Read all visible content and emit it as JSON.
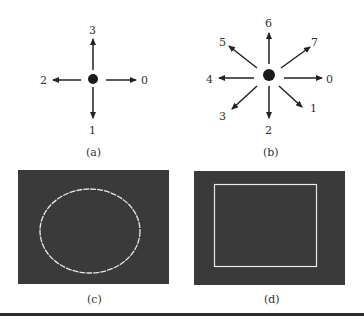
{
  "figures": {
    "a": {
      "caption": "(a)",
      "title": "4-direction chain code",
      "directions": [
        {
          "code": "0",
          "angle_deg": 0
        },
        {
          "code": "1",
          "angle_deg": 270
        },
        {
          "code": "2",
          "angle_deg": 180
        },
        {
          "code": "3",
          "angle_deg": 90
        }
      ]
    },
    "b": {
      "caption": "(b)",
      "title": "8-direction chain code",
      "directions": [
        {
          "code": "0",
          "angle_deg": 0
        },
        {
          "code": "1",
          "angle_deg": 315
        },
        {
          "code": "2",
          "angle_deg": 270
        },
        {
          "code": "3",
          "angle_deg": 225
        },
        {
          "code": "4",
          "angle_deg": 180
        },
        {
          "code": "5",
          "angle_deg": 135
        },
        {
          "code": "6",
          "angle_deg": 90
        },
        {
          "code": "7",
          "angle_deg": 45
        }
      ]
    },
    "c": {
      "caption": "(c)",
      "shape": "ellipse boundary"
    },
    "d": {
      "caption": "(d)",
      "shape": "rectangle boundary"
    }
  },
  "colors": {
    "panel_bg": "#3a3a3a",
    "boundary": "#e8e8e8",
    "arrow": "#222222"
  }
}
